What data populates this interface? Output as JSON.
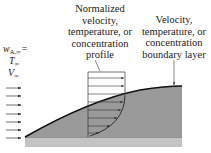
{
  "diagram": {
    "profile_label": {
      "lines": [
        "Normalized",
        "velocity,",
        "temperature, or",
        "concentration",
        "profile"
      ]
    },
    "boundary_layer_label": {
      "lines": [
        "Velocity,",
        "temperature, or",
        "concentration",
        "boundary layer"
      ]
    },
    "free_stream": {
      "w_symbol": "w",
      "w_subscript": "A,∞",
      "w_equals": "=",
      "T_symbol": "T",
      "T_subscript": "∞",
      "V_symbol": "V",
      "V_subscript": "∞",
      "arrow_count": 7
    },
    "colors": {
      "boundary_layer_fill": "#9a9a9a",
      "plate_fill": "#c4c4c4",
      "line": "#1a1a1a",
      "arrow": "#333333"
    }
  }
}
